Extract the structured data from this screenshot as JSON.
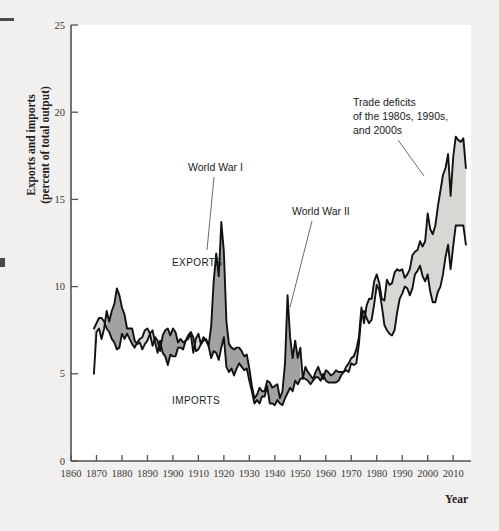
{
  "figure": {
    "background_color": "#f1f0ee",
    "plot_background_color": "#ffffff",
    "axis_color": "#55524f"
  },
  "axes": {
    "y_title_line1": "Exports and imports",
    "y_title_line2": "(percent of total output)",
    "x_title": "Year",
    "y_ticks": [
      "0",
      "5",
      "10",
      "15",
      "20",
      "25"
    ],
    "x_ticks": [
      "1860",
      "1870",
      "1880",
      "1890",
      "1900",
      "1910",
      "1920",
      "1930",
      "1940",
      "1950",
      "1960",
      "1970",
      "1980",
      "1990",
      "2000",
      "2010"
    ]
  },
  "labels": {
    "exports": "EXPORTS",
    "imports": "IMPORTS",
    "world_war_1": "World War I",
    "world_war_2": "World War II",
    "trade_deficits_line1": "Trade deficits",
    "trade_deficits_line2": "of the 1980s, 1990s,",
    "trade_deficits_line3": "and 2000s"
  },
  "colors": {
    "surplus_fill": "#d8d7d4",
    "deficit_fill": "#a3a2a0",
    "line": "#121212"
  },
  "chart_data": {
    "type": "area",
    "title": "",
    "xlabel": "Year",
    "ylabel": "Exports and imports (percent of total output)",
    "xlim": [
      1860,
      2017
    ],
    "ylim": [
      0,
      25
    ],
    "grid": false,
    "legend": "inline-labels",
    "annotations": [
      {
        "text": "World War I",
        "x": 1917,
        "y": 13.7
      },
      {
        "text": "World War II",
        "x": 1944,
        "y": 9.5
      },
      {
        "text": "Trade deficits of the 1980s, 1990s, and 2000s",
        "x": 1998,
        "y": 16.0
      }
    ],
    "x": [
      1869,
      1870,
      1871,
      1872,
      1873,
      1874,
      1875,
      1876,
      1877,
      1878,
      1879,
      1880,
      1881,
      1882,
      1883,
      1884,
      1885,
      1886,
      1887,
      1888,
      1889,
      1890,
      1891,
      1892,
      1893,
      1894,
      1895,
      1896,
      1897,
      1898,
      1899,
      1900,
      1901,
      1902,
      1903,
      1904,
      1905,
      1906,
      1907,
      1908,
      1909,
      1910,
      1911,
      1912,
      1913,
      1914,
      1915,
      1916,
      1917,
      1918,
      1919,
      1920,
      1921,
      1922,
      1923,
      1924,
      1925,
      1926,
      1927,
      1928,
      1929,
      1930,
      1931,
      1932,
      1933,
      1934,
      1935,
      1936,
      1937,
      1938,
      1939,
      1940,
      1941,
      1942,
      1943,
      1944,
      1945,
      1946,
      1947,
      1948,
      1949,
      1950,
      1951,
      1952,
      1953,
      1954,
      1955,
      1956,
      1957,
      1958,
      1959,
      1960,
      1961,
      1962,
      1963,
      1964,
      1965,
      1966,
      1967,
      1968,
      1969,
      1970,
      1971,
      1972,
      1973,
      1974,
      1975,
      1976,
      1977,
      1978,
      1979,
      1980,
      1981,
      1982,
      1983,
      1984,
      1985,
      1986,
      1987,
      1988,
      1989,
      1990,
      1991,
      1992,
      1993,
      1994,
      1995,
      1996,
      1997,
      1998,
      1999,
      2000,
      2001,
      2002,
      2003,
      2004,
      2005,
      2006,
      2007,
      2008,
      2009,
      2010,
      2011,
      2012,
      2013,
      2014,
      2015
    ],
    "series": [
      {
        "name": "EXPORTS",
        "values": [
          5.0,
          7.4,
          7.6,
          7.0,
          7.6,
          8.6,
          8.0,
          8.6,
          9.0,
          9.9,
          9.5,
          8.8,
          8.4,
          7.6,
          7.6,
          7.6,
          6.9,
          6.7,
          6.8,
          6.4,
          6.7,
          6.9,
          7.3,
          6.6,
          7.1,
          6.9,
          6.3,
          7.2,
          7.5,
          7.6,
          7.2,
          7.6,
          7.4,
          6.8,
          7.0,
          6.8,
          6.9,
          7.2,
          7.4,
          7.1,
          6.3,
          6.4,
          6.7,
          6.9,
          7.0,
          6.6,
          7.7,
          10.3,
          11.9,
          10.6,
          13.7,
          12.0,
          8.0,
          6.7,
          6.5,
          6.4,
          6.5,
          6.5,
          6.3,
          6.0,
          6.1,
          5.3,
          4.3,
          3.6,
          3.8,
          4.2,
          4.0,
          4.0,
          4.6,
          4.5,
          4.2,
          4.3,
          4.4,
          3.6,
          4.0,
          5.6,
          9.5,
          7.1,
          5.9,
          6.9,
          5.9,
          6.5,
          4.7,
          5.4,
          5.1,
          4.9,
          4.7,
          5.1,
          5.4,
          5.0,
          4.7,
          5.2,
          5.1,
          4.9,
          5.0,
          5.2,
          5.1,
          5.1,
          5.1,
          5.2,
          5.1,
          5.6,
          5.5,
          5.6,
          6.7,
          8.4,
          8.6,
          8.2,
          7.9,
          8.1,
          9.0,
          10.1,
          9.8,
          8.9,
          7.8,
          7.5,
          7.3,
          7.2,
          7.5,
          8.5,
          9.3,
          9.6,
          10.0,
          9.9,
          9.5,
          9.9,
          10.7,
          10.9,
          11.2,
          10.6,
          10.3,
          10.7,
          9.7,
          9.1,
          9.1,
          9.7,
          10.0,
          10.7,
          11.7,
          12.4,
          11.0,
          12.3,
          13.5,
          13.5,
          13.5,
          13.5,
          12.4
        ]
      },
      {
        "name": "IMPORTS",
        "values": [
          7.6,
          7.9,
          8.2,
          8.2,
          8.0,
          7.6,
          7.4,
          7.0,
          6.8,
          6.4,
          6.5,
          7.3,
          7.0,
          7.3,
          7.0,
          6.7,
          6.5,
          6.8,
          7.0,
          7.1,
          7.5,
          7.6,
          7.3,
          7.5,
          6.8,
          6.2,
          6.9,
          6.2,
          6.0,
          5.5,
          6.1,
          6.0,
          6.0,
          6.5,
          6.5,
          6.4,
          6.9,
          7.0,
          7.3,
          6.2,
          7.0,
          7.3,
          6.7,
          7.1,
          6.9,
          6.6,
          5.9,
          6.3,
          6.2,
          5.8,
          6.5,
          7.1,
          5.4,
          5.1,
          5.3,
          4.9,
          5.3,
          5.6,
          5.4,
          5.2,
          5.3,
          4.6,
          4.0,
          3.3,
          3.5,
          3.3,
          3.7,
          3.7,
          4.3,
          3.3,
          3.3,
          3.2,
          3.5,
          3.3,
          3.2,
          3.6,
          3.9,
          4.2,
          4.0,
          4.6,
          4.4,
          4.7,
          4.8,
          4.7,
          4.6,
          4.4,
          4.6,
          4.8,
          4.8,
          4.6,
          5.0,
          4.6,
          4.5,
          4.5,
          4.5,
          4.5,
          4.6,
          4.9,
          5.1,
          5.4,
          5.6,
          5.9,
          6.0,
          6.4,
          7.1,
          8.8,
          7.9,
          8.9,
          9.3,
          9.3,
          10.3,
          10.7,
          10.2,
          9.3,
          9.2,
          10.4,
          10.1,
          10.2,
          10.8,
          11.0,
          10.9,
          11.0,
          10.5,
          10.7,
          11.0,
          11.8,
          12.0,
          12.1,
          12.6,
          12.3,
          12.6,
          14.2,
          13.3,
          13.0,
          13.5,
          14.6,
          15.5,
          16.4,
          16.8,
          17.6,
          15.2,
          17.4,
          18.6,
          18.4,
          18.3,
          18.5,
          16.8
        ]
      }
    ],
    "peak_notes": {
      "ww1_exports_peak": 13.7,
      "ww2_exports_peak": 9.5,
      "max_imports_2008": 17.6,
      "max_imports_2011": 18.6
    }
  }
}
